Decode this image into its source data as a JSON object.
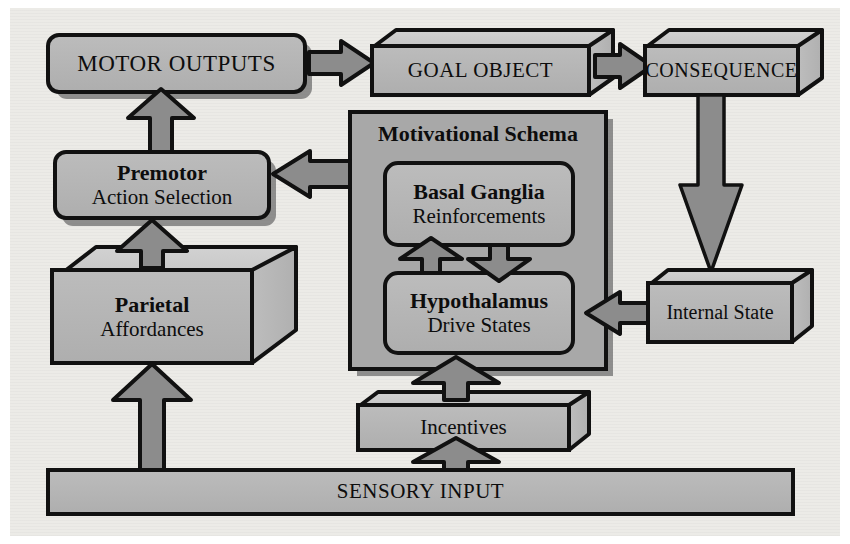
{
  "diagram": {
    "colors": {
      "background": "#ecebe7",
      "box_fill": "#b2b2b2",
      "box_fill_light": "#c3c3c3",
      "panel_fill": "#a8a8a8",
      "arrow_fill": "#8c8c8c",
      "arrow_fill_dark": "#7e7e7e",
      "stroke": "#111111",
      "shadow": "#6f6f6f"
    },
    "nodes": {
      "motor_outputs": {
        "label": "MOTOR OUTPUTS",
        "shape": "rounded-rect"
      },
      "goal_object": {
        "label": "GOAL OBJECT",
        "shape": "3d-box"
      },
      "consequence": {
        "label": "CONSEQUENCE",
        "shape": "3d-box"
      },
      "motivational_schema": {
        "label": "Motivational Schema",
        "shape": "panel"
      },
      "basal_ganglia": {
        "title": "Basal Ganglia",
        "subtitle": "Reinforcements",
        "shape": "rounded-rect"
      },
      "hypothalamus": {
        "title": "Hypothalamus",
        "subtitle": "Drive States",
        "shape": "rounded-rect"
      },
      "premotor": {
        "title": "Premotor",
        "subtitle": "Action Selection",
        "shape": "rounded-rect"
      },
      "parietal": {
        "title": "Parietal",
        "subtitle": "Affordances",
        "shape": "3d-box"
      },
      "internal_state": {
        "label": "Internal State",
        "shape": "3d-box"
      },
      "incentives": {
        "label": "Incentives",
        "shape": "3d-box"
      },
      "sensory_input": {
        "label": "SENSORY INPUT",
        "shape": "bar"
      }
    },
    "edges": [
      {
        "name": "motor-outputs-to-goal-object",
        "from": "motor_outputs",
        "to": "goal_object",
        "direction": "right"
      },
      {
        "name": "goal-object-to-consequence",
        "from": "goal_object",
        "to": "consequence",
        "direction": "right"
      },
      {
        "name": "consequence-to-internal-state",
        "from": "consequence",
        "to": "internal_state",
        "direction": "down"
      },
      {
        "name": "internal-state-to-hypothalamus",
        "from": "internal_state",
        "to": "hypothalamus",
        "direction": "left"
      },
      {
        "name": "motivational-schema-to-premotor",
        "from": "motivational_schema",
        "to": "premotor",
        "direction": "left"
      },
      {
        "name": "premotor-to-motor-outputs",
        "from": "premotor",
        "to": "motor_outputs",
        "direction": "up"
      },
      {
        "name": "parietal-to-premotor",
        "from": "parietal",
        "to": "premotor",
        "direction": "up"
      },
      {
        "name": "sensory-input-to-parietal",
        "from": "sensory_input",
        "to": "parietal",
        "direction": "up"
      },
      {
        "name": "sensory-input-to-incentives",
        "from": "sensory_input",
        "to": "incentives",
        "direction": "up"
      },
      {
        "name": "incentives-to-motivational-schema",
        "from": "incentives",
        "to": "motivational_schema",
        "direction": "up"
      },
      {
        "name": "hypothalamus-to-basal-ganglia",
        "from": "hypothalamus",
        "to": "basal_ganglia",
        "direction": "up"
      },
      {
        "name": "basal-ganglia-to-hypothalamus",
        "from": "basal_ganglia",
        "to": "hypothalamus",
        "direction": "down"
      }
    ]
  }
}
